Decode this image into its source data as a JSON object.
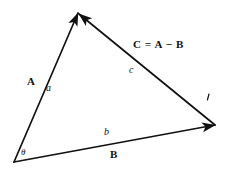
{
  "figure": {
    "type": "vector-triangle-diagram",
    "width": 228,
    "height": 175,
    "background_color": "#ffffff",
    "stroke_color": "#111111"
  },
  "labels": {
    "vector_a": "A",
    "vector_b": "B",
    "side_a": "a",
    "side_b": "b",
    "side_c": "c",
    "angle_theta": "θ",
    "equation": "C = A − B"
  },
  "geometry": {
    "vertex_origin": {
      "x": 14,
      "y": 162
    },
    "vertex_apex": {
      "x": 78,
      "y": 13
    },
    "vertex_right": {
      "x": 215,
      "y": 125
    },
    "vectors": [
      {
        "name": "A",
        "from": "vertex_origin",
        "to": "vertex_apex",
        "arrow": "head"
      },
      {
        "name": "B",
        "from": "vertex_origin",
        "to": "vertex_right",
        "arrow": "head"
      },
      {
        "name": "C",
        "from": "vertex_right",
        "to": "vertex_apex",
        "arrow": "head"
      }
    ],
    "tick_mark": {
      "x": 208,
      "y": 97
    }
  }
}
